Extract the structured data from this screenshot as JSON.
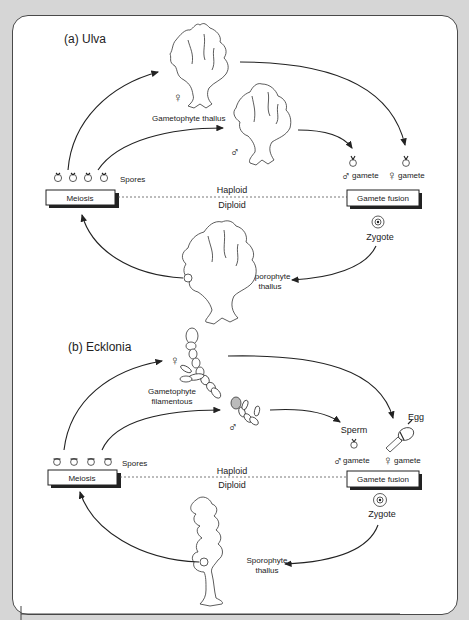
{
  "panels": [
    {
      "id": "ulva",
      "title": "(a) Ulva",
      "gametophyte_label": "Gametophyte thallus",
      "female_symbol": "♀",
      "male_symbol": "♂",
      "spores_label": "Spores",
      "meiosis_label": "Meiosis",
      "haploid_label": "Haploid",
      "diploid_label": "Diploid",
      "male_gamete_label": "gamete",
      "female_gamete_label": "gamete",
      "fusion_label": "Gamete fusion",
      "zygote_label": "Zygote",
      "sporophyte_label_line1": "Sporophyte",
      "sporophyte_label_line2": "thallus"
    },
    {
      "id": "ecklonia",
      "title": "(b) Ecklonia",
      "gametophyte_label_line1": "Gametophyte",
      "gametophyte_label_line2": "filamentous",
      "female_symbol": "♀",
      "male_symbol": "♂",
      "sperm_label": "Sperm",
      "egg_label": "Egg",
      "spores_label": "Spores",
      "meiosis_label": "Meiosis",
      "haploid_label": "Haploid",
      "diploid_label": "Diploid",
      "male_gamete_label": "gamete",
      "female_gamete_label": "gamete",
      "fusion_label": "Gamete fusion",
      "zygote_label": "Zygote",
      "sporophyte_label_line1": "Sporophyte",
      "sporophyte_label_line2": "thallus"
    }
  ],
  "colors": {
    "background": "#d6d6d6",
    "card": "#ffffff",
    "ink": "#222222"
  }
}
